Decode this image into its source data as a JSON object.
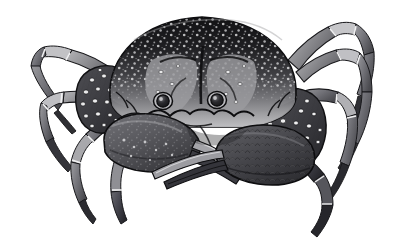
{
  "figure": {
    "kind": "natural-history-illustration",
    "view": "dorsal",
    "medium": "grayscale stipple and line engraving",
    "background_color": "#ffffff",
    "caption": "",
    "title": "",
    "has_text_labels": false,
    "canvas": {
      "width": 409,
      "height": 248
    }
  },
  "palette": {
    "background": "#ffffff",
    "carapace_dark": "#1d1d1f",
    "carapace_mid": "#4a4a4d",
    "carapace_light": "#8e8e90",
    "shell_highlight": "#c9c9cb",
    "speckle_light": "#e8e8e8",
    "leg_light": "#a5a5a7",
    "leg_mid": "#6e6e71",
    "leg_dark": "#3a3a3c",
    "outline": "#111113",
    "eye_dark": "#1a1a1c",
    "eye_ring": "#d5d5d7"
  },
  "anatomy": {
    "carapace": {
      "name": "carapace",
      "shape": "broad transverse oval, widest across the middle",
      "bounds": {
        "x": 100,
        "y": 16,
        "width": 205,
        "height": 110
      },
      "top_tone": "#1d1d1f",
      "bottom_tone": "#9a9a9c",
      "texture": "dense white granular tubercles over a near-black ground, fading to smooth pale gray along the lower margin",
      "front_margin": "scalloped with rounded lobes between the orbits"
    },
    "eyes": [
      {
        "name": "left-eye",
        "cx": 163,
        "cy": 101,
        "r": 7.5,
        "tone": "#1a1a1c"
      },
      {
        "name": "right-eye",
        "cx": 217,
        "cy": 100,
        "r": 7.5,
        "tone": "#1a1a1c"
      }
    ],
    "chelipeds": [
      {
        "name": "left-cheliped",
        "side": "left",
        "propodus": "large smooth ovate claw with scattered pale speckles",
        "bounds": {
          "x": 96,
          "y": 112,
          "width": 108,
          "height": 62
        },
        "finger_direction": "down and to the right",
        "tone": "#55555a"
      },
      {
        "name": "right-cheliped",
        "side": "right",
        "propodus": "heavier claw with an imbricate scaled surface",
        "bounds": {
          "x": 196,
          "y": 122,
          "width": 120,
          "height": 64
        },
        "finger_direction": "down and to the left",
        "tone": "#46464a"
      }
    ],
    "walking_legs": [
      {
        "name": "left-leg-1",
        "side": "left",
        "segments": 4,
        "direction": "upper-left",
        "tone": "#8d8d90"
      },
      {
        "name": "left-leg-2",
        "side": "left",
        "segments": 4,
        "direction": "left",
        "tone": "#7d7d80"
      },
      {
        "name": "left-leg-3",
        "side": "left",
        "segments": 4,
        "direction": "lower-left",
        "tone": "#6b6b6e"
      },
      {
        "name": "left-leg-4",
        "side": "left",
        "segments": 4,
        "direction": "down",
        "tone": "#5e5e62"
      },
      {
        "name": "right-leg-1",
        "side": "right",
        "segments": 4,
        "direction": "upper-right",
        "tone": "#8d8d90"
      },
      {
        "name": "right-leg-2",
        "side": "right",
        "segments": 4,
        "direction": "right",
        "tone": "#85858a"
      },
      {
        "name": "right-leg-3",
        "side": "right",
        "segments": 4,
        "direction": "lower-right",
        "tone": "#76767a"
      },
      {
        "name": "right-leg-4",
        "side": "right",
        "segments": 4,
        "direction": "down",
        "tone": "#46464a"
      }
    ],
    "merus_tubercles": {
      "name": "merus-tubercles",
      "description": "rows of raised pale ringed tubercles on the dark merus of each cheliped",
      "count_left": 18,
      "count_right": 22
    }
  }
}
